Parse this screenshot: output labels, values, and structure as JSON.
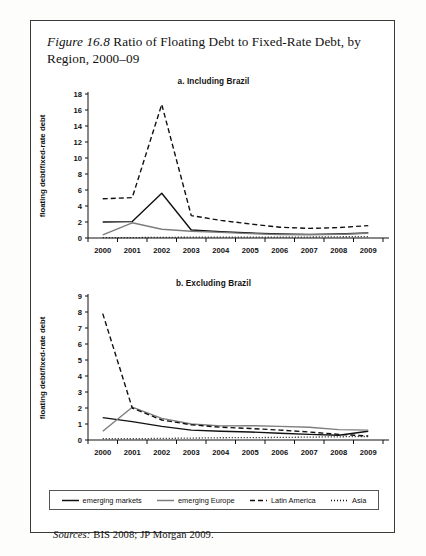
{
  "figure": {
    "label": "Figure 16.8",
    "title": "Ratio of Floating Debt to Fixed-Rate Debt, by Region, 2000–09",
    "sources_label": "Sources:",
    "sources_text": "BIS 2008; JP Morgan 2009."
  },
  "legend": {
    "items": [
      {
        "label": "emerging markets",
        "style": "solid",
        "color": "#111111"
      },
      {
        "label": "emerging Europe",
        "style": "solid",
        "color": "#7d7d7d"
      },
      {
        "label": "Latin America",
        "style": "dashed",
        "color": "#111111"
      },
      {
        "label": "Asia",
        "style": "dotted",
        "color": "#111111"
      }
    ]
  },
  "chart_data": [
    {
      "type": "line",
      "panel": "a",
      "title": "a. Including Brazil",
      "xlabel": "",
      "ylabel": "floating debt/fixed-rate debt",
      "x": [
        2000,
        2001,
        2002,
        2003,
        2004,
        2005,
        2006,
        2007,
        2008,
        2009
      ],
      "xtick_labels": [
        "2000",
        "2001",
        "2002",
        "2003",
        "2004",
        "2005",
        "2006",
        "2007",
        "2008",
        "2009"
      ],
      "ylim": [
        0,
        18
      ],
      "yticks": [
        0,
        2,
        4,
        6,
        8,
        10,
        12,
        14,
        16,
        18
      ],
      "grid": false,
      "legend_position": "bottom",
      "series": [
        {
          "name": "emerging markets",
          "style": "solid",
          "color": "#111111",
          "values": [
            2.0,
            2.05,
            5.6,
            1.0,
            0.8,
            0.62,
            0.5,
            0.45,
            0.5,
            0.62
          ]
        },
        {
          "name": "emerging Europe",
          "style": "solid",
          "color": "#7d7d7d",
          "values": [
            0.4,
            1.9,
            1.1,
            0.85,
            0.7,
            0.55,
            0.42,
            0.4,
            0.45,
            0.6
          ]
        },
        {
          "name": "Latin America",
          "style": "dashed",
          "color": "#111111",
          "values": [
            4.9,
            5.05,
            16.7,
            2.8,
            2.2,
            1.75,
            1.35,
            1.2,
            1.3,
            1.55
          ]
        },
        {
          "name": "Asia",
          "style": "dotted",
          "color": "#111111",
          "values": [
            0.05,
            0.05,
            0.08,
            0.1,
            0.12,
            0.12,
            0.12,
            0.12,
            0.15,
            0.18
          ]
        }
      ]
    },
    {
      "type": "line",
      "panel": "b",
      "title": "b. Excluding Brazil",
      "xlabel": "",
      "ylabel": "floating debt/fixed-rate debt",
      "x": [
        2000,
        2001,
        2002,
        2003,
        2004,
        2005,
        2006,
        2007,
        2008,
        2009
      ],
      "xtick_labels": [
        "2000",
        "2001",
        "2002",
        "2003",
        "2004",
        "2005",
        "2006",
        "2007",
        "2008",
        "2009"
      ],
      "ylim": [
        0,
        9
      ],
      "yticks": [
        0,
        1,
        2,
        3,
        4,
        5,
        6,
        7,
        8,
        9
      ],
      "grid": false,
      "legend_position": "bottom",
      "series": [
        {
          "name": "emerging markets",
          "style": "solid",
          "color": "#111111",
          "values": [
            1.4,
            1.15,
            0.85,
            0.62,
            0.55,
            0.5,
            0.42,
            0.35,
            0.3,
            0.55
          ]
        },
        {
          "name": "emerging Europe",
          "style": "solid",
          "color": "#7d7d7d",
          "values": [
            0.55,
            2.05,
            1.35,
            1.0,
            0.88,
            0.9,
            0.85,
            0.8,
            0.65,
            0.62
          ]
        },
        {
          "name": "Latin America",
          "style": "dashed",
          "color": "#111111",
          "values": [
            7.9,
            2.0,
            1.25,
            0.95,
            0.8,
            0.72,
            0.62,
            0.5,
            0.35,
            0.25
          ]
        },
        {
          "name": "Asia",
          "style": "dotted",
          "color": "#111111",
          "values": [
            0.08,
            0.08,
            0.1,
            0.12,
            0.14,
            0.15,
            0.16,
            0.18,
            0.2,
            0.22
          ]
        }
      ]
    }
  ]
}
